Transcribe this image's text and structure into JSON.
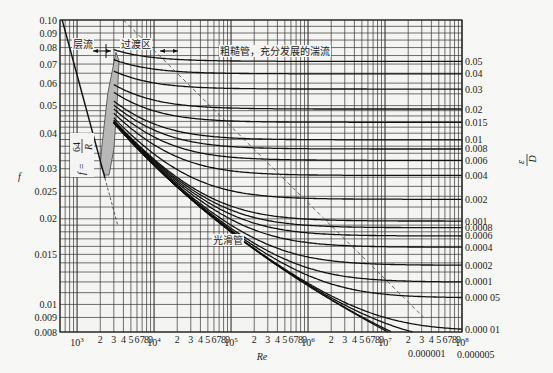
{
  "chart_data": {
    "type": "line",
    "xlabel": "Re",
    "ylabel": "f",
    "y2label": "ε/D",
    "xscale": "log",
    "yscale": "log",
    "xlim": [
      600,
      100000000
    ],
    "ylim": [
      0.008,
      0.1
    ],
    "grid": true,
    "y_ticks": [
      "0.10",
      "0.09",
      "0.08",
      "0.07",
      "0.06",
      "0.05",
      "0.04",
      "0.03",
      "0.025",
      "0.02",
      "0.015",
      "0.01",
      "0.009",
      "0.008"
    ],
    "y_tick_values": [
      0.1,
      0.09,
      0.08,
      0.07,
      0.06,
      0.05,
      0.04,
      0.03,
      0.025,
      0.02,
      0.015,
      0.01,
      0.009,
      0.008
    ],
    "x_decade_labels": [
      {
        "value": 1000,
        "label": "10",
        "exp": "3"
      },
      {
        "value": 10000,
        "label": "10",
        "exp": "4"
      },
      {
        "value": 100000,
        "label": "10",
        "exp": "5"
      },
      {
        "value": 1000000,
        "label": "10",
        "exp": "6"
      },
      {
        "value": 10000000,
        "label": "10",
        "exp": "7"
      },
      {
        "value": 100000000,
        "label": "10",
        "exp": "8"
      }
    ],
    "x_minor_labels": [
      "2",
      "3",
      "4",
      "5",
      "6",
      "7",
      "8",
      "9"
    ],
    "relative_roughness": [
      {
        "value": 0.05,
        "label": "0.05"
      },
      {
        "value": 0.04,
        "label": "0.04"
      },
      {
        "value": 0.03,
        "label": "0.03"
      },
      {
        "value": 0.02,
        "label": "0.02"
      },
      {
        "value": 0.015,
        "label": "0.015"
      },
      {
        "value": 0.01,
        "label": "0.01"
      },
      {
        "value": 0.008,
        "label": "0.008"
      },
      {
        "value": 0.006,
        "label": "0.006"
      },
      {
        "value": 0.004,
        "label": "0.004"
      },
      {
        "value": 0.002,
        "label": "0.002"
      },
      {
        "value": 0.001,
        "label": "0.001"
      },
      {
        "value": 0.0008,
        "label": "0.0008"
      },
      {
        "value": 0.0006,
        "label": "0.0006"
      },
      {
        "value": 0.0004,
        "label": "0.0004"
      },
      {
        "value": 0.0002,
        "label": "0.0002"
      },
      {
        "value": 0.0001,
        "label": "0.0001"
      },
      {
        "value": 5e-05,
        "label": "0.000 05"
      },
      {
        "value": 1e-05,
        "label": "0.000 01"
      },
      {
        "value": 5e-06,
        "label": "0.000005"
      },
      {
        "value": 1e-06,
        "label": "0.000001"
      }
    ],
    "laminar": {
      "formula": "f = 64/R",
      "x_range": [
        600,
        2300
      ]
    },
    "annotations": {
      "laminar": "层流",
      "transition": "过渡区",
      "rough": "粗糙管，充分发展的湍流",
      "smooth": "光滑管",
      "laminar_formula_top": "64",
      "laminar_formula_lhs": "f =",
      "laminar_formula_den": "R"
    }
  }
}
